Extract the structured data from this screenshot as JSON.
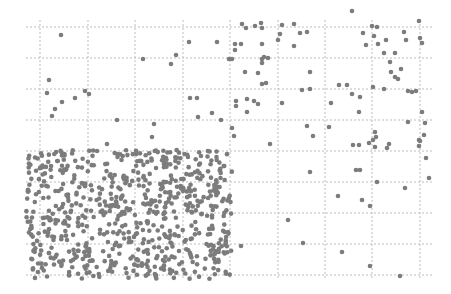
{
  "chart_data": {
    "type": "scatter",
    "title": "",
    "xlabel": "",
    "ylabel": "",
    "grid": true,
    "legend": null,
    "marker_color": "#7c7c7c",
    "grid_color": "#bdbdbd",
    "plot_area_px": {
      "left": 26,
      "top": 20,
      "right": 432,
      "bottom": 280
    },
    "grid_x_px": [
      40,
      88,
      135,
      183,
      230,
      278,
      325,
      372,
      420
    ],
    "grid_y_px": [
      27,
      58,
      89,
      120,
      151,
      182,
      213,
      244,
      275
    ],
    "regions": [
      {
        "name": "dense-cluster",
        "bounds_px": {
          "x0": 26,
          "y0": 150,
          "x1": 232,
          "y1": 279
        },
        "approx_point_count": 700
      },
      {
        "name": "sparse-scatter",
        "bounds_px": {
          "x0": 26,
          "y0": 20,
          "x1": 432,
          "y1": 280
        }
      }
    ],
    "sparse_points_px": [
      [
        61,
        35
      ],
      [
        49,
        80
      ],
      [
        47,
        93
      ],
      [
        62,
        102
      ],
      [
        55,
        109
      ],
      [
        52,
        116
      ],
      [
        75,
        98
      ],
      [
        85,
        91
      ],
      [
        89,
        94
      ],
      [
        117,
        120
      ],
      [
        107,
        144
      ],
      [
        143,
        59
      ],
      [
        171,
        64
      ],
      [
        176,
        55
      ],
      [
        189,
        42
      ],
      [
        217,
        42
      ],
      [
        197,
        98
      ],
      [
        190,
        98
      ],
      [
        212,
        113
      ],
      [
        198,
        117
      ],
      [
        221,
        120
      ],
      [
        154,
        124
      ],
      [
        152,
        137
      ],
      [
        229,
        59
      ],
      [
        232,
        59
      ],
      [
        235,
        50
      ],
      [
        235,
        44
      ],
      [
        241,
        44
      ],
      [
        242,
        24
      ],
      [
        246,
        28
      ],
      [
        255,
        26
      ],
      [
        261,
        23
      ],
      [
        262,
        28
      ],
      [
        262,
        44
      ],
      [
        262,
        59
      ],
      [
        262,
        63
      ],
      [
        264,
        57
      ],
      [
        268,
        58
      ],
      [
        245,
        72
      ],
      [
        258,
        73
      ],
      [
        262,
        84
      ],
      [
        266,
        83
      ],
      [
        236,
        101
      ],
      [
        236,
        106
      ],
      [
        247,
        99
      ],
      [
        254,
        101
      ],
      [
        258,
        104
      ],
      [
        247,
        112
      ],
      [
        232,
        128
      ],
      [
        234,
        136
      ],
      [
        278,
        40
      ],
      [
        280,
        34
      ],
      [
        282,
        25
      ],
      [
        294,
        24
      ],
      [
        300,
        33
      ],
      [
        307,
        32
      ],
      [
        294,
        46
      ],
      [
        310,
        72
      ],
      [
        302,
        90
      ],
      [
        310,
        89
      ],
      [
        282,
        103
      ],
      [
        307,
        126
      ],
      [
        313,
        136
      ],
      [
        329,
        127
      ],
      [
        331,
        103
      ],
      [
        339,
        85
      ],
      [
        347,
        85
      ],
      [
        352,
        94
      ],
      [
        359,
        145
      ],
      [
        360,
        97
      ],
      [
        369,
        143
      ],
      [
        359,
        112
      ],
      [
        363,
        33
      ],
      [
        366,
        45
      ],
      [
        374,
        36
      ],
      [
        372,
        26
      ],
      [
        377,
        27
      ],
      [
        378,
        44
      ],
      [
        386,
        40
      ],
      [
        384,
        53
      ],
      [
        395,
        53
      ],
      [
        390,
        62
      ],
      [
        391,
        72
      ],
      [
        401,
        69
      ],
      [
        395,
        77
      ],
      [
        398,
        79
      ],
      [
        404,
        32
      ],
      [
        406,
        40
      ],
      [
        373,
        87
      ],
      [
        384,
        89
      ],
      [
        408,
        91
      ],
      [
        412,
        92
      ],
      [
        416,
        91
      ],
      [
        420,
        38
      ],
      [
        422,
        43
      ],
      [
        422,
        112
      ],
      [
        425,
        123
      ],
      [
        408,
        122
      ],
      [
        373,
        140
      ],
      [
        376,
        137
      ],
      [
        375,
        132
      ],
      [
        375,
        147
      ],
      [
        387,
        148
      ],
      [
        419,
        140
      ],
      [
        419,
        146
      ],
      [
        424,
        135
      ],
      [
        419,
        21
      ],
      [
        352,
        11
      ],
      [
        310,
        172
      ],
      [
        270,
        144
      ],
      [
        356,
        170
      ],
      [
        360,
        170
      ],
      [
        377,
        182
      ],
      [
        405,
        188
      ],
      [
        338,
        196
      ],
      [
        362,
        200
      ],
      [
        370,
        206
      ],
      [
        288,
        220
      ],
      [
        303,
        243
      ],
      [
        342,
        252
      ],
      [
        370,
        266
      ],
      [
        400,
        276
      ],
      [
        241,
        246
      ],
      [
        426,
        158
      ],
      [
        429,
        178
      ],
      [
        353,
        145
      ],
      [
        389,
        144
      ],
      [
        420,
        141
      ]
    ],
    "dense_seed": 12345
  }
}
